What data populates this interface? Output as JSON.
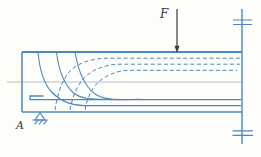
{
  "diagram": {
    "force_label": "F",
    "support_label": "A"
  },
  "colors": {
    "line_blue": "#4c86c2",
    "centerline": "#a9bac9",
    "ink": "#3a3a3a",
    "bg": "#fdfdfa"
  }
}
